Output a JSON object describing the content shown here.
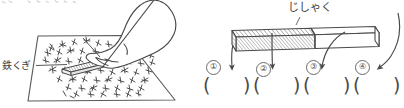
{
  "figure": {
    "title_clipped_top_text": "と　わるところ",
    "left_panel": {
      "name": "nails-and-magnet-illustration",
      "label": "鉄くぎ",
      "label_meaning": "iron nails",
      "elements": [
        "hand",
        "magnet-bar",
        "scattered-nails",
        "tray-parallelogram",
        "leader-line"
      ]
    },
    "right_panel": {
      "name": "bar-magnet-diagram",
      "label": "じしゃく",
      "label_meaning": "magnet",
      "markers": [
        {
          "num": "①",
          "answer_blank": "(　　)"
        },
        {
          "num": "②",
          "answer_blank": "(　　)"
        },
        {
          "num": "③",
          "answer_blank": "(　　)"
        },
        {
          "num": "④",
          "answer_blank": "(　　)"
        }
      ],
      "paren_open": "(",
      "paren_close": ")",
      "shading": {
        "left_half": "hatched",
        "right_half": "plain"
      }
    }
  },
  "colors": {
    "ink": "#4a4a4a",
    "ink_light": "#7a7a7a",
    "hatch": "#8a8a8a",
    "paper": "#ffffff"
  }
}
